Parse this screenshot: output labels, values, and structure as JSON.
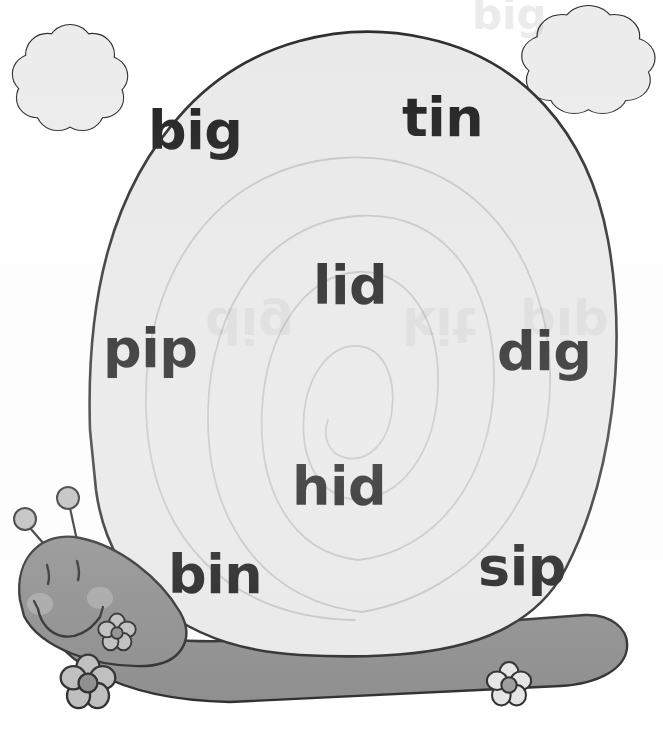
{
  "page": {
    "background_color": "#ffffff",
    "width": 663,
    "height": 735
  },
  "colors": {
    "shell_fill": "#e9e9e9",
    "shell_outline": "#2b2b2b",
    "shell_spiral_line": "#c6c6c6",
    "snail_body": "#8c8c8c",
    "snail_body_outline": "#2b2b2b",
    "snail_cheek": "#a5a5a5",
    "antenna_ball": "#bdbdbd",
    "flower_petal": "#bdbdbd",
    "flower_center": "#8c8c8c",
    "cloud_fill": "#ececec",
    "cloud_outline": "#2b2b2b",
    "word_text": "#1c1c1c"
  },
  "shell": {
    "name": "snail-shell",
    "spiral_turns": 3,
    "words": [
      {
        "text": "big",
        "x": 148,
        "y": 104,
        "size": 52
      },
      {
        "text": "tin",
        "x": 402,
        "y": 91,
        "size": 52
      },
      {
        "text": "lid",
        "x": 313,
        "y": 259,
        "size": 52
      },
      {
        "text": "pip",
        "x": 103,
        "y": 322,
        "size": 52
      },
      {
        "text": "dig",
        "x": 497,
        "y": 325,
        "size": 52
      },
      {
        "text": "hid",
        "x": 292,
        "y": 460,
        "size": 52
      },
      {
        "text": "bin",
        "x": 168,
        "y": 548,
        "size": 52
      },
      {
        "text": "sip",
        "x": 478,
        "y": 540,
        "size": 52
      }
    ]
  },
  "ghost_text": {
    "description": "faint bleed-through from the reverse side of the page",
    "items": [
      {
        "text": "dig",
        "x": 205,
        "y": 300,
        "size": 50
      },
      {
        "text": "kit",
        "x": 402,
        "y": 300,
        "size": 50
      },
      {
        "text": "pip",
        "x": 520,
        "y": 300,
        "size": 50
      },
      {
        "text": "big",
        "x": 472,
        "y": 2,
        "size": 42
      }
    ]
  },
  "clouds": [
    {
      "name": "cloud-left",
      "cx": 68,
      "cy": 78,
      "rx": 52,
      "ry": 48
    },
    {
      "name": "cloud-right",
      "cx": 586,
      "cy": 62,
      "rx": 62,
      "ry": 48
    }
  ],
  "snail": {
    "name": "snail-character",
    "eyes": 2,
    "cheeks": 2,
    "antennae": 2,
    "mouth": "smile",
    "flowers": [
      {
        "name": "flower-small-head",
        "cx": 117,
        "cy": 633,
        "r": 17
      },
      {
        "name": "flower-large-foot",
        "cx": 88,
        "cy": 683,
        "r": 24
      },
      {
        "name": "flower-tail",
        "cx": 509,
        "cy": 685,
        "r": 20
      }
    ]
  },
  "word_list": [
    "big",
    "tin",
    "lid",
    "pip",
    "dig",
    "hid",
    "bin",
    "sip"
  ]
}
